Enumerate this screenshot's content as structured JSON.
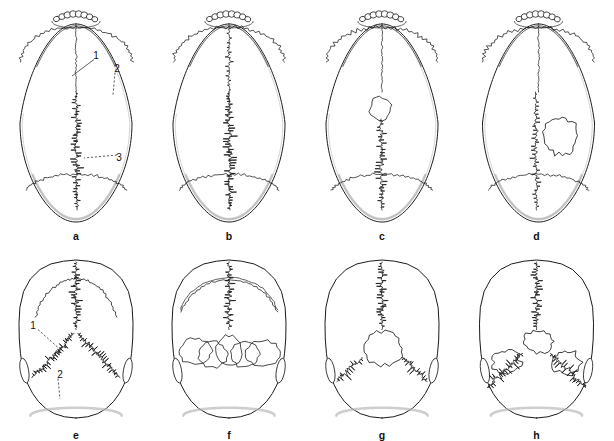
{
  "figure": {
    "background_color": "#ffffff",
    "ink_color": "#1a1a1a",
    "shade_color": "#b9b9b9",
    "width": 614,
    "height": 441,
    "rows": 2,
    "columns": 4
  },
  "panels": [
    {
      "id": "a",
      "letter": "a",
      "view": "norma-verticalis",
      "description": "Superior view of skull with normal metopic remnant, coronal suture and complex sagittal suture",
      "callouts": [
        {
          "label": "1",
          "x": 96,
          "y": 56,
          "tip_x": 72,
          "tip_y": 76,
          "style": "solid"
        },
        {
          "label": "2",
          "x": 117,
          "y": 69,
          "tip_x": 113,
          "tip_y": 95,
          "style": "dashed"
        },
        {
          "label": "3",
          "x": 119,
          "y": 158,
          "tip_x": 84,
          "tip_y": 158,
          "style": "dashed"
        }
      ]
    },
    {
      "id": "b",
      "letter": "b",
      "view": "norma-verticalis",
      "description": "Superior view with heavily serrated, broad sagittal suture",
      "callouts": []
    },
    {
      "id": "c",
      "letter": "c",
      "view": "norma-verticalis",
      "description": "Superior view with small bregmatic sutural bone at the junction of coronal and sagittal sutures",
      "callouts": []
    },
    {
      "id": "d",
      "letter": "d",
      "view": "norma-verticalis",
      "description": "Superior view with isolated parietal wormian bone island lateral to the sagittal suture",
      "callouts": []
    },
    {
      "id": "e",
      "letter": "e",
      "view": "norma-occipitalis",
      "description": "Posterior view showing sagittal and lambdoid sutures, no wormian bones",
      "callouts": [
        {
          "label": "1",
          "x": 33,
          "y": 326,
          "tip_x": 62,
          "tip_y": 351,
          "style": "dashed"
        },
        {
          "label": "2",
          "x": 60,
          "y": 375,
          "tip_x": 60,
          "tip_y": 399,
          "style": "dashed"
        }
      ]
    },
    {
      "id": "f",
      "letter": "f",
      "view": "norma-occipitalis",
      "description": "Posterior view with a row of five large wormian bones along the lambdoid suture",
      "callouts": []
    },
    {
      "id": "g",
      "letter": "g",
      "view": "norma-occipitalis",
      "description": "Posterior view with a single large interparietal (Inca) bone at lambda",
      "callouts": []
    },
    {
      "id": "h",
      "letter": "h",
      "view": "norma-occipitalis",
      "description": "Posterior view with multiple irregular wormian bones across the lambdoid suture",
      "callouts": []
    }
  ]
}
